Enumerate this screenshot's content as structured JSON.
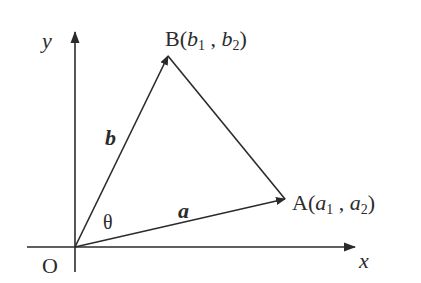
{
  "diagram": {
    "axes": {
      "x_label": "x",
      "y_label": "y",
      "origin_label": "O"
    },
    "points": {
      "A": {
        "name": "A",
        "open": "(",
        "c1": "a",
        "s1": "1",
        "sep": " , ",
        "c2": "a",
        "s2": "2",
        "close": ")"
      },
      "B": {
        "name": "B",
        "open": "(",
        "c1": "b",
        "s1": "1",
        "sep": " , ",
        "c2": "b",
        "s2": "2",
        "close": ")"
      }
    },
    "vectors": {
      "a_label": "a",
      "b_label": "b"
    },
    "angle_label": "θ",
    "colors": {
      "stroke": "#2b2b2b",
      "background": "#ffffff"
    }
  }
}
